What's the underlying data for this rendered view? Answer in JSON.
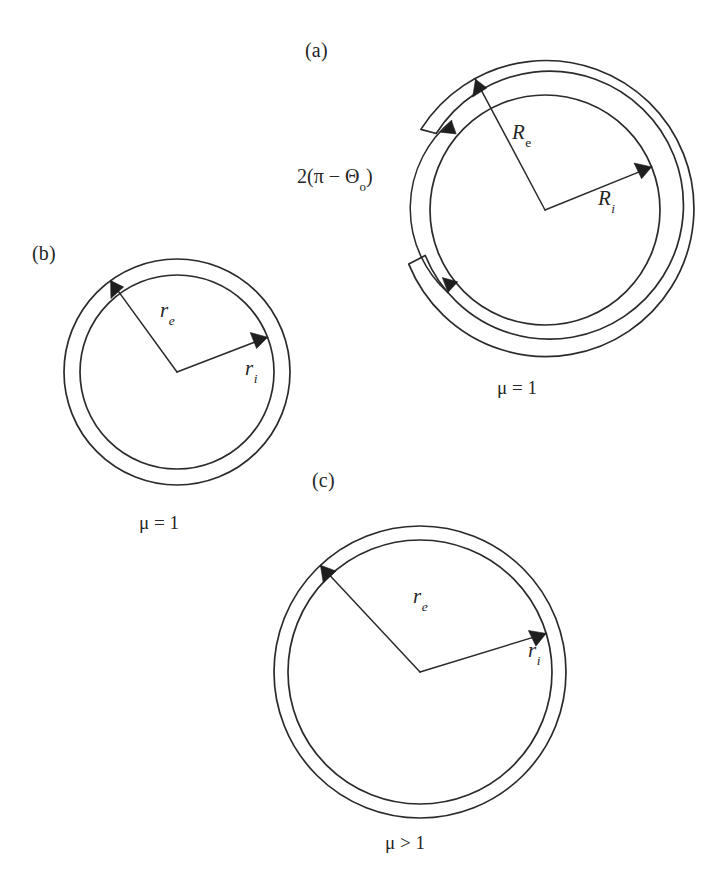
{
  "figure": {
    "background_color": "#ffffff",
    "stroke_color": "#2b2b2b",
    "panels": [
      {
        "id": "a",
        "tag": "(a)",
        "tag_x": 305,
        "tag_y": 40,
        "caption": "μ = 1",
        "caption_x": 497,
        "caption_y": 378,
        "geometry": {
          "cx": 545,
          "cy": 210,
          "outer_radius": 148,
          "shell_inner_radius": 134,
          "inner_circle_radius": 115,
          "gap_start_deg": 147,
          "gap_end_deg": 203,
          "arc_indicator_radius": 113
        },
        "labels": [
          {
            "name": "outer-radius",
            "symbol": "R",
            "subscript": "e",
            "subscript_style": "upright",
            "x": 512,
            "y": 122,
            "arrow_angle_deg": 118,
            "arrow_length": 148
          },
          {
            "name": "inner-radius",
            "symbol": "R",
            "subscript": "i",
            "subscript_style": "italic",
            "x": 598,
            "y": 188,
            "arrow_angle_deg": 22,
            "arrow_length": 115
          }
        ],
        "angle_annotation": {
          "text_plain": "2(π − Θo)",
          "lead": "2(",
          "pi": "π",
          "minus": " − ",
          "theta": "Θ",
          "theta_subscript": "o",
          "trail": ")",
          "x": 297,
          "y": 166
        }
      },
      {
        "id": "b",
        "tag": "(b)",
        "tag_x": 32,
        "tag_y": 243,
        "caption": "μ = 1",
        "caption_x": 139,
        "caption_y": 513,
        "geometry": {
          "cx": 177,
          "cy": 372,
          "outer_radius": 113,
          "inner_radius": 97
        },
        "labels": [
          {
            "name": "outer-radius",
            "symbol": "r",
            "subscript": "e",
            "subscript_style": "italic",
            "x": 160,
            "y": 300,
            "arrow_angle_deg": 126,
            "arrow_length": 113
          },
          {
            "name": "inner-radius",
            "symbol": "r",
            "subscript": "i",
            "subscript_style": "italic",
            "x": 245,
            "y": 358,
            "arrow_angle_deg": 21,
            "arrow_length": 97
          }
        ]
      },
      {
        "id": "c",
        "tag": "(c)",
        "tag_x": 312,
        "tag_y": 470,
        "caption": "μ > 1",
        "caption_x": 385,
        "caption_y": 833,
        "geometry": {
          "cx": 420,
          "cy": 672,
          "outer_radius": 146,
          "inner_radius": 132
        },
        "labels": [
          {
            "name": "outer-radius",
            "symbol": "r",
            "subscript": "e",
            "subscript_style": "italic",
            "x": 413,
            "y": 586,
            "arrow_angle_deg": 133,
            "arrow_length": 146
          },
          {
            "name": "inner-radius",
            "symbol": "r",
            "subscript": "i",
            "subscript_style": "italic",
            "x": 528,
            "y": 640,
            "arrow_angle_deg": 17,
            "arrow_length": 132
          }
        ]
      }
    ]
  }
}
